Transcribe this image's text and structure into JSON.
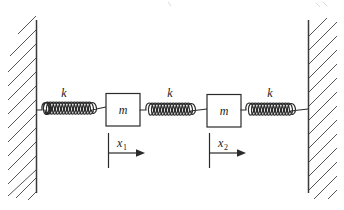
{
  "figure": {
    "type": "mechanics-schematic",
    "background_color": "#ffffff",
    "line_color": "#2b2b2b",
    "hatch_color": "#555555",
    "wall_color": "#3a3a3a"
  },
  "walls": {
    "left": {
      "name": "left-wall",
      "x": 36.5,
      "y_top": 20,
      "y_bottom": 193,
      "hatch_side": "left"
    },
    "right": {
      "name": "right-wall",
      "x": 308.5,
      "y_top": 20,
      "y_bottom": 193,
      "hatch_side": "right"
    }
  },
  "springs": [
    {
      "id": "spring-1",
      "label": "k",
      "label_x": 64,
      "label_y": 97,
      "x_start": 37,
      "x_end": 106,
      "y": 110,
      "coils": 7
    },
    {
      "id": "spring-2",
      "label": "k",
      "label_x": 170,
      "label_y": 97,
      "x_start": 140,
      "x_end": 207,
      "y": 111,
      "coils": 7
    },
    {
      "id": "spring-3",
      "label": "k",
      "label_x": 270,
      "label_y": 97,
      "x_start": 240,
      "x_end": 308,
      "y": 111,
      "coils": 7
    }
  ],
  "masses": [
    {
      "id": "mass-1",
      "label": "m",
      "x": 106,
      "y": 93,
      "width": 34,
      "height": 33
    },
    {
      "id": "mass-2",
      "label": "m",
      "x": 207,
      "y": 94,
      "width": 34,
      "height": 33
    }
  ],
  "coordinates": [
    {
      "id": "coordinate-x1",
      "symbol": "x",
      "subscript": "1",
      "label_x": 120,
      "label_y": 147,
      "tick_x": 108,
      "tick_y_top": 133,
      "tick_y_bottom": 168,
      "arrow_y": 153,
      "arrow_x_end": 144,
      "direction": "right"
    },
    {
      "id": "coordinate-x2",
      "symbol": "x",
      "subscript": "2",
      "label_x": 221,
      "label_y": 147,
      "tick_x": 209,
      "tick_y_top": 133,
      "tick_y_bottom": 168,
      "arrow_y": 153,
      "arrow_x_end": 245,
      "direction": "right"
    }
  ],
  "legend": {
    "spring_symbol": "k",
    "mass_symbol": "m",
    "displacement_symbols": [
      "x1",
      "x2"
    ]
  }
}
